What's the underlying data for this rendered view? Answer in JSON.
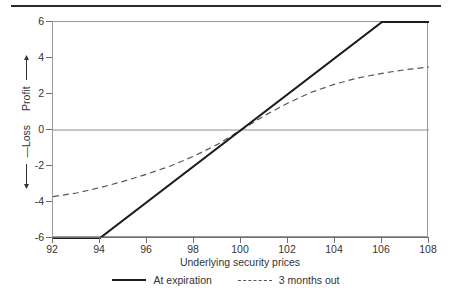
{
  "chart_data": {
    "type": "line",
    "title": "",
    "xlabel": "Underlying security prices",
    "ylabel_positive": "Profit",
    "ylabel_negative": "—Loss",
    "xlim": [
      92,
      108
    ],
    "ylim": [
      -6,
      6
    ],
    "xticks": [
      92,
      94,
      96,
      98,
      100,
      102,
      104,
      106,
      108
    ],
    "yticks": [
      6,
      4,
      2,
      0,
      -2,
      -4,
      -6
    ],
    "grid": false,
    "legend_position": "below",
    "zero_line": true,
    "series": [
      {
        "name": "At expiration",
        "style": "solid",
        "color": "#1c1c1c",
        "x": [
          92,
          94,
          100,
          106,
          108
        ],
        "y": [
          -6,
          -6,
          0,
          6,
          6
        ]
      },
      {
        "name": "3 months out",
        "style": "dashed",
        "color": "#555555",
        "x": [
          92,
          93,
          94,
          95,
          96,
          97,
          98,
          99,
          100,
          101,
          102,
          103,
          104,
          105,
          106,
          107,
          108
        ],
        "y": [
          -3.7,
          -3.5,
          -3.2,
          -2.85,
          -2.45,
          -2.0,
          -1.45,
          -0.8,
          0.0,
          0.8,
          1.5,
          2.1,
          2.55,
          2.9,
          3.15,
          3.35,
          3.5
        ]
      }
    ]
  },
  "axes": {
    "x_title": "Underlying security prices",
    "x_tick_labels": [
      "92",
      "94",
      "96",
      "98",
      "100",
      "102",
      "104",
      "106",
      "108"
    ],
    "y_tick_labels": [
      "6",
      "4",
      "2",
      "0",
      "-2",
      "-4",
      "-6"
    ],
    "y_title_upper": "Profit",
    "y_title_lower": "—Loss"
  },
  "legend": {
    "items": [
      {
        "label": "At expiration",
        "style": "solid"
      },
      {
        "label": "3 months out",
        "style": "dashed"
      }
    ]
  }
}
